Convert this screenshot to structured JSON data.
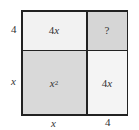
{
  "diagram": {
    "cells": {
      "top_left": {
        "label": "4x",
        "coef": "4",
        "var": "x",
        "fill": "#f2f2f2"
      },
      "top_right": {
        "label": "?",
        "fill": "#d6d6d6"
      },
      "bottom_left": {
        "label": "x^2",
        "var": "x",
        "exp": "2",
        "fill": "#d9d9d9"
      },
      "bottom_right": {
        "label": "4x",
        "coef": "4",
        "var": "x",
        "fill": "#f4f4f4"
      }
    },
    "side_labels": {
      "left_top": "4",
      "left_bottom": "x",
      "bottom_left": "x",
      "bottom_right": "4"
    },
    "line_color": "#222222"
  }
}
